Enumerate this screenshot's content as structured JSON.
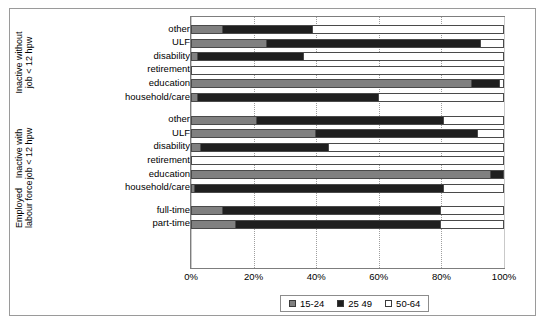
{
  "chart_data": {
    "type": "bar",
    "orientation": "horizontal",
    "stacked": true,
    "stacked_percent": true,
    "title": "",
    "xlabel": "",
    "ylabel": "",
    "xlim": [
      0,
      100
    ],
    "xtick_labels": [
      "0%",
      "20%",
      "40%",
      "60%",
      "80%",
      "100%"
    ],
    "xtick_values": [
      0,
      20,
      40,
      60,
      80,
      100
    ],
    "grid": true,
    "legend_position": "bottom",
    "legend": [
      "15-24",
      "25 49",
      "50-64"
    ],
    "series": [
      {
        "name": "15-24",
        "color": "#808080",
        "values": [
          10,
          24,
          2,
          0,
          90,
          2,
          21,
          40,
          3,
          0,
          96,
          1,
          10,
          14
        ]
      },
      {
        "name": "25 49",
        "color": "#1f1f1f",
        "values": [
          29,
          69,
          34,
          0,
          9,
          58,
          60,
          52,
          41,
          0,
          4,
          80,
          70,
          66
        ]
      },
      {
        "name": "50-64",
        "color": "#ffffff",
        "values": [
          61,
          7,
          64,
          100,
          1,
          40,
          19,
          8,
          56,
          100,
          0,
          19,
          20,
          20
        ]
      }
    ],
    "categories": [
      "other",
      "ULF",
      "disability",
      "retirement",
      "education",
      "household/care",
      "other",
      "ULF",
      "disability",
      "retirement",
      "education",
      "household/care",
      "full-time",
      "part-time"
    ],
    "groups": [
      {
        "label_lines": [
          "Inactive without",
          "job < 12 hpw"
        ],
        "categories": [
          "other",
          "ULF",
          "disability",
          "retirement",
          "education",
          "household/care"
        ]
      },
      {
        "label_lines": [
          "Inactive with",
          "job < 12 hpw"
        ],
        "categories": [
          "other",
          "ULF",
          "disability",
          "retirement",
          "education",
          "household/care"
        ]
      },
      {
        "label_lines": [
          "Employed",
          "labour force"
        ],
        "categories": [
          "full-time",
          "part-time"
        ]
      }
    ]
  },
  "axis": {
    "ticks": [
      {
        "label": "0%",
        "value": 0
      },
      {
        "label": "20%",
        "value": 20
      },
      {
        "label": "40%",
        "value": 40
      },
      {
        "label": "60%",
        "value": 60
      },
      {
        "label": "80%",
        "value": 80
      },
      {
        "label": "100%",
        "value": 100
      }
    ]
  },
  "rows": [
    {
      "label": "other",
      "group": 0,
      "a": 10,
      "b": 29,
      "c": 61
    },
    {
      "label": "ULF",
      "group": 0,
      "a": 24,
      "b": 69,
      "c": 7
    },
    {
      "label": "disability",
      "group": 0,
      "a": 2,
      "b": 34,
      "c": 64
    },
    {
      "label": "retirement",
      "group": 0,
      "a": 0,
      "b": 0,
      "c": 100
    },
    {
      "label": "education",
      "group": 0,
      "a": 90,
      "b": 9,
      "c": 1
    },
    {
      "label": "household/care",
      "group": 0,
      "a": 2,
      "b": 58,
      "c": 40
    },
    {
      "label": "other",
      "group": 1,
      "a": 21,
      "b": 60,
      "c": 19
    },
    {
      "label": "ULF",
      "group": 1,
      "a": 40,
      "b": 52,
      "c": 8
    },
    {
      "label": "disability",
      "group": 1,
      "a": 3,
      "b": 41,
      "c": 56
    },
    {
      "label": "retirement",
      "group": 1,
      "a": 0,
      "b": 0,
      "c": 100
    },
    {
      "label": "education",
      "group": 1,
      "a": 96,
      "b": 4,
      "c": 0
    },
    {
      "label": "household/care",
      "group": 1,
      "a": 1,
      "b": 80,
      "c": 19
    },
    {
      "label": "full-time",
      "group": 2,
      "a": 10,
      "b": 70,
      "c": 20
    },
    {
      "label": "part-time",
      "group": 2,
      "a": 14,
      "b": 66,
      "c": 20
    }
  ],
  "legend": {
    "items": [
      {
        "label": "15-24",
        "color": "#808080"
      },
      {
        "label": "25 49",
        "color": "#1f1f1f"
      },
      {
        "label": "50-64",
        "color": "#ffffff"
      }
    ]
  },
  "colors": {
    "series_15_24": "#808080",
    "series_25_49": "#1f1f1f",
    "series_50_64": "#ffffff",
    "frame": "#9a9a9a",
    "grid": "#c9c9c9"
  }
}
